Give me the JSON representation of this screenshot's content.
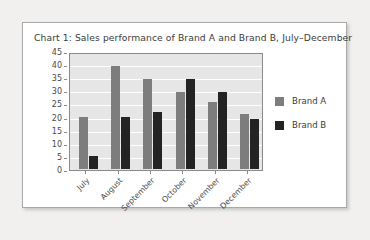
{
  "card": {
    "title": "Chart 1: Sales performance of Brand A and Brand B, July–December"
  },
  "chart_data": {
    "type": "bar",
    "title": "Chart 1: Sales performance of Brand A and Brand B, July–December",
    "xlabel": "",
    "ylabel": "",
    "ylim": [
      0,
      45
    ],
    "ytick_step": 5,
    "yticks": [
      "45",
      "40",
      "35",
      "30",
      "25",
      "20",
      "15",
      "10",
      "5",
      "0"
    ],
    "grid": true,
    "legend_position": "right",
    "categories": [
      "July",
      "August",
      "September",
      "October",
      "November",
      "December"
    ],
    "series": [
      {
        "name": "Brand A",
        "color": "#7d7d7d",
        "values": [
          20,
          40,
          35,
          30,
          26,
          21.5
        ]
      },
      {
        "name": "Brand B",
        "color": "#232323",
        "values": [
          5,
          20,
          22,
          35,
          30,
          19.5
        ]
      }
    ]
  },
  "legend": {
    "items": [
      {
        "label": "Brand A",
        "swatch": "sw-a"
      },
      {
        "label": "Brand B",
        "swatch": "sw-b"
      }
    ]
  },
  "colors": {
    "page_background": "#f1f0ee",
    "card_background": "#ffffff",
    "card_border": "#a9a9a9",
    "plot_background": "#e6e6e6",
    "plot_border": "#8a8a8a",
    "gridline": "#ffffff",
    "brand_a": "#7d7d7d",
    "brand_b": "#232323",
    "text": "#3b3b3b"
  }
}
